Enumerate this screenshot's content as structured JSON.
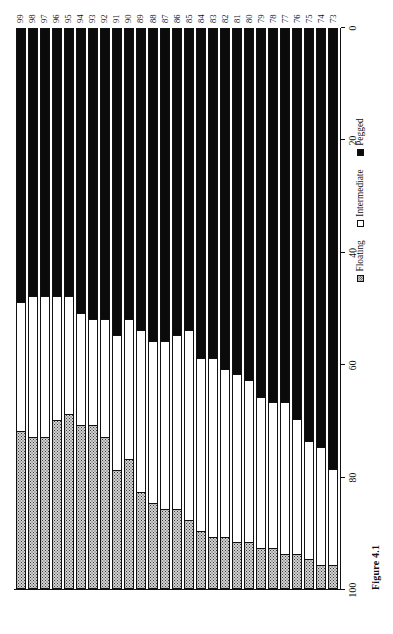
{
  "figure": {
    "caption": "Figure 4.1",
    "orientation": "rotated-90"
  },
  "legend": {
    "position": "bottom-right",
    "items": [
      {
        "label": "Floating",
        "swatch": "hatched-dotted",
        "color": "#d2d2d2"
      },
      {
        "label": "Intermediate",
        "swatch": "white",
        "color": "#ffffff"
      },
      {
        "label": "Pegged",
        "swatch": "black",
        "color": "#0b0b0b"
      }
    ]
  },
  "value_axis": {
    "ticks": [
      100,
      80,
      60,
      40,
      20,
      0
    ],
    "min": 0,
    "max": 100
  },
  "chart_data": {
    "type": "bar",
    "subtype": "stacked-horizontal-100percent",
    "title": "Figure 4.1",
    "xlabel": "",
    "ylabel": "",
    "ylim": [
      0,
      100
    ],
    "grid": false,
    "legend_position": "bottom-right",
    "categories": [
      "73",
      "74",
      "75",
      "76",
      "77",
      "78",
      "79",
      "80",
      "81",
      "82",
      "83",
      "84",
      "85",
      "86",
      "87",
      "88",
      "89",
      "90",
      "91",
      "92",
      "93",
      "94",
      "95",
      "96",
      "97",
      "98",
      "99"
    ],
    "series": [
      {
        "name": "Floating",
        "values": [
          4,
          4,
          5,
          6,
          6,
          7,
          7,
          8,
          8,
          9,
          9,
          10,
          12,
          14,
          14,
          15,
          17,
          23,
          21,
          27,
          29,
          29,
          31,
          30,
          27,
          27,
          28
        ]
      },
      {
        "name": "Intermediate",
        "values": [
          17,
          21,
          21,
          24,
          27,
          26,
          27,
          29,
          30,
          30,
          32,
          31,
          34,
          31,
          30,
          29,
          29,
          25,
          24,
          21,
          19,
          20,
          21,
          22,
          25,
          25,
          23
        ]
      },
      {
        "name": "Pegged",
        "values": [
          79,
          75,
          74,
          70,
          67,
          67,
          66,
          63,
          62,
          61,
          59,
          59,
          54,
          55,
          56,
          56,
          54,
          52,
          55,
          52,
          52,
          51,
          48,
          48,
          48,
          48,
          49
        ]
      }
    ]
  }
}
